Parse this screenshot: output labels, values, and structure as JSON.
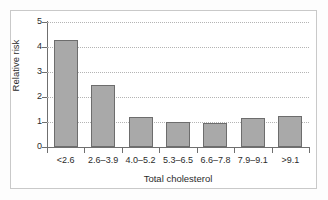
{
  "chart_data": {
    "type": "bar",
    "title": "",
    "xlabel": "Total cholesterol",
    "ylabel": "Relative risk",
    "categories": [
      "<2.6",
      "2.6–3.9",
      "4.0–5.2",
      "5.3–6.5",
      "6.6–7.8",
      "7.9–9.1",
      ">9.1"
    ],
    "values": [
      4.3,
      2.48,
      1.2,
      1.0,
      0.97,
      1.15,
      1.24
    ],
    "ylim": [
      0,
      5
    ],
    "yticks": [
      "0",
      "1",
      "2",
      "3",
      "4",
      "5"
    ],
    "ytick_values": [
      0,
      1,
      2,
      3,
      4,
      5
    ],
    "grid": "horizontal-dotted",
    "legend": "none",
    "bar_color": "#a9a9a9",
    "bar_edge_color": "#6d6d6d",
    "axis_color": "#6f6f6f",
    "grid_color": "#b4b4b4",
    "frame_color": "#c9c9c9"
  }
}
